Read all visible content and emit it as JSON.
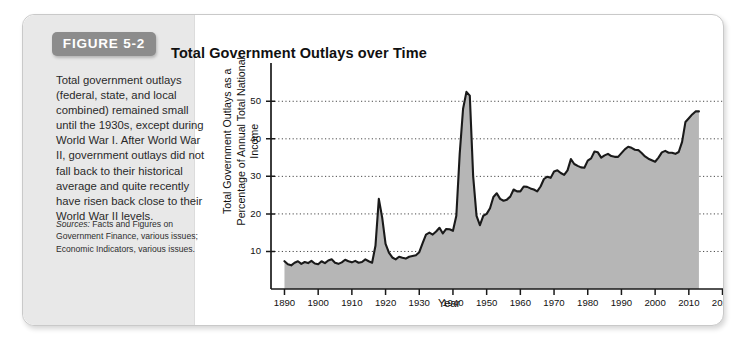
{
  "figure": {
    "badge_label": "FIGURE 5-2",
    "caption": "Total government outlays (federal, state, and local combined) remained small until the 1930s, except during World War I. After World War II, government outlays did not fall back to their historical average and quite recently have risen back close to their World War II levels.",
    "sources_label": "Sources:",
    "sources_text": " Facts and Figures on Government Finance, various issues; Economic Indicators, various issues."
  },
  "colors": {
    "panel_gray": "#e8e8e8",
    "badge_gray": "#8c8c8c",
    "area_fill": "#b6b6b6",
    "line": "#1a1a1a",
    "grid": "#4a4a4a",
    "frame_border": "#c9c9c9"
  },
  "chart_data": {
    "type": "area",
    "title": "Total Government Outlays over Time",
    "xlabel": "Year",
    "ylabel": "Total Government Outlays as a Percentage of Annual Total National Income",
    "xlim": [
      1886,
      2024
    ],
    "ylim": [
      0,
      57
    ],
    "xticks": [
      1890,
      1900,
      1910,
      1920,
      1930,
      1940,
      1950,
      1960,
      1970,
      1980,
      1990,
      2000,
      2010,
      2020
    ],
    "yticks": [
      10,
      20,
      30,
      40,
      50
    ],
    "grid": "horizontal-dotted",
    "legend": "none",
    "series": [
      {
        "name": "Total government outlays as a percentage of annual total national income",
        "x": [
          1890,
          1891,
          1892,
          1893,
          1894,
          1895,
          1896,
          1897,
          1898,
          1899,
          1900,
          1901,
          1902,
          1903,
          1904,
          1905,
          1906,
          1907,
          1908,
          1909,
          1910,
          1911,
          1912,
          1913,
          1914,
          1915,
          1916,
          1917,
          1918,
          1919,
          1920,
          1921,
          1922,
          1923,
          1924,
          1925,
          1926,
          1927,
          1928,
          1929,
          1930,
          1931,
          1932,
          1933,
          1934,
          1935,
          1936,
          1937,
          1938,
          1939,
          1940,
          1941,
          1942,
          1943,
          1944,
          1945,
          1946,
          1947,
          1948,
          1949,
          1950,
          1951,
          1952,
          1953,
          1954,
          1955,
          1956,
          1957,
          1958,
          1959,
          1960,
          1961,
          1962,
          1963,
          1964,
          1965,
          1966,
          1967,
          1968,
          1969,
          1970,
          1971,
          1972,
          1973,
          1974,
          1975,
          1976,
          1977,
          1978,
          1979,
          1980,
          1981,
          1982,
          1983,
          1984,
          1985,
          1986,
          1987,
          1988,
          1989,
          1990,
          1991,
          1992,
          1993,
          1994,
          1995,
          1996,
          1997,
          1998,
          1999,
          2000,
          2001,
          2002,
          2003,
          2004,
          2005,
          2006,
          2007,
          2008,
          2009,
          2010,
          2011,
          2012,
          2013
        ],
        "values": [
          7.4,
          6.6,
          6.3,
          7.0,
          7.4,
          6.7,
          7.2,
          6.9,
          7.5,
          6.8,
          6.6,
          7.4,
          6.9,
          7.6,
          7.9,
          7.0,
          6.7,
          7.1,
          7.8,
          7.4,
          7.1,
          7.5,
          7.0,
          7.2,
          7.9,
          7.4,
          7.0,
          11.5,
          24.0,
          19.0,
          12.0,
          9.7,
          8.4,
          7.9,
          8.6,
          8.3,
          8.1,
          8.6,
          8.8,
          9.0,
          9.8,
          12.2,
          14.5,
          15.0,
          14.5,
          15.3,
          16.3,
          14.8,
          16.0,
          15.9,
          15.5,
          19.5,
          36.0,
          48.0,
          52.5,
          51.5,
          30.0,
          19.5,
          17.0,
          19.5,
          20.0,
          21.5,
          24.5,
          25.5,
          24.0,
          23.5,
          23.8,
          24.6,
          26.5,
          26.0,
          26.0,
          27.3,
          27.2,
          26.8,
          26.5,
          26.0,
          27.3,
          29.3,
          29.9,
          29.6,
          31.3,
          31.6,
          30.9,
          30.4,
          31.6,
          34.6,
          33.3,
          32.8,
          32.4,
          32.3,
          34.2,
          34.8,
          36.6,
          36.4,
          35.0,
          35.6,
          36.0,
          35.4,
          35.2,
          35.2,
          36.2,
          37.2,
          37.9,
          37.6,
          37.1,
          37.0,
          36.2,
          35.3,
          34.7,
          34.3,
          33.9,
          35.0,
          36.4,
          36.8,
          36.3,
          36.3,
          36.0,
          36.5,
          39.2,
          44.5,
          45.5,
          46.5,
          47.3,
          47.3
        ]
      }
    ],
    "annotations": []
  }
}
